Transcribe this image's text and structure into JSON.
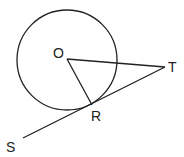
{
  "diagram": {
    "type": "geometry",
    "stroke_color": "#222222",
    "background": "#ffffff",
    "circle": {
      "center_label": "O",
      "cx": 67,
      "cy": 60,
      "r": 50
    },
    "points": {
      "O": {
        "label": "O",
        "x": 67,
        "y": 59
      },
      "R": {
        "label": "R",
        "x": 92,
        "y": 105
      },
      "T": {
        "label": "T",
        "x": 165,
        "y": 67
      },
      "S": {
        "label": "S",
        "x": 23,
        "y": 138
      }
    },
    "segments": [
      {
        "name": "OT",
        "from": "O",
        "to": "T"
      },
      {
        "name": "OR",
        "from": "O",
        "to": "R"
      },
      {
        "name": "ST",
        "from": "S",
        "to": "T"
      }
    ]
  }
}
